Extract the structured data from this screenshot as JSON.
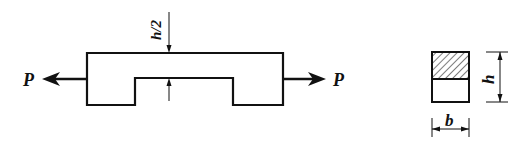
{
  "diagram": {
    "type": "mechanics-figure",
    "colors": {
      "stroke": "#111111",
      "background": "#ffffff"
    },
    "labels": {
      "force_left": "P",
      "force_right": "P",
      "notch_depth": "h/2",
      "height": "h",
      "width": "b"
    },
    "bar": {
      "outer": {
        "x1": 87,
        "x2": 283,
        "top": 53,
        "bottom": 105
      },
      "notch": {
        "x1": 135,
        "x2": 233,
        "top": 78
      }
    },
    "forces": [
      {
        "name": "left",
        "direction": "left",
        "y": 79,
        "from_x": 87,
        "to_x": 42
      },
      {
        "name": "right",
        "direction": "right",
        "y": 79,
        "from_x": 283,
        "to_x": 326
      }
    ],
    "cross_section": {
      "x": 432,
      "y": 52,
      "width": 37,
      "height": 50,
      "hatched_part": "top half",
      "divider_y": 79
    }
  }
}
